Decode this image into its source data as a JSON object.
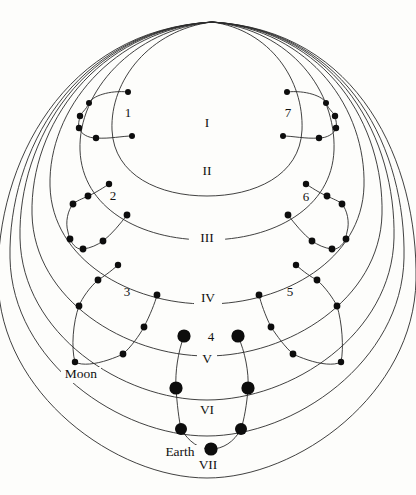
{
  "diagram": {
    "background_color": "#fdfdfb",
    "line_color": "#2b2b2b",
    "dot_color": "#0d0d0d",
    "apex": {
      "x": 212,
      "y": 22
    },
    "orbit_labels": [
      {
        "id": "orbit-I",
        "text": "I",
        "x": 207,
        "y": 124
      },
      {
        "id": "orbit-II",
        "text": "II",
        "x": 207,
        "y": 172
      },
      {
        "id": "orbit-III",
        "text": "III",
        "x": 207,
        "y": 239
      },
      {
        "id": "orbit-IV",
        "text": "IV",
        "x": 208,
        "y": 299
      },
      {
        "id": "orbit-V",
        "text": "V",
        "x": 207,
        "y": 360
      },
      {
        "id": "orbit-VI",
        "text": "VI",
        "x": 207,
        "y": 411
      },
      {
        "id": "orbit-VII",
        "text": "VII",
        "x": 208,
        "y": 466
      }
    ],
    "epicycle_labels": [
      {
        "id": "epicycle-1",
        "text": "1",
        "x": 128,
        "y": 114
      },
      {
        "id": "epicycle-2",
        "text": "2",
        "x": 113,
        "y": 197
      },
      {
        "id": "epicycle-3",
        "text": "3",
        "x": 127,
        "y": 293
      },
      {
        "id": "epicycle-4",
        "text": "4",
        "x": 211,
        "y": 338
      },
      {
        "id": "epicycle-5",
        "text": "5",
        "x": 290,
        "y": 293
      },
      {
        "id": "epicycle-6",
        "text": "6",
        "x": 306,
        "y": 198
      },
      {
        "id": "epicycle-7",
        "text": "7",
        "x": 288,
        "y": 114
      }
    ],
    "body_labels": [
      {
        "id": "label-moon",
        "text": "Moon",
        "x": 81,
        "y": 375
      },
      {
        "id": "label-earth",
        "text": "Earth",
        "x": 180,
        "y": 453
      }
    ],
    "orbit_arcs": [
      {
        "id": "arc-I",
        "d": "M212,22 C150,30 110,80 112,130 C114,176 160,196 207,196 C254,196 300,176 302,130 C304,80 270,30 212,22"
      },
      {
        "id": "arc-II",
        "d": "M212,22 C132,30 78,92 80,150 C82,208 140,240 207,240 C274,240 332,208 334,150 C336,92 292,30 212,22"
      },
      {
        "id": "arc-III",
        "d": "M212,22 C112,30 48,110 50,186 C52,260 130,304 207,304 C284,304 362,260 364,186 C366,110 312,30 212,22"
      },
      {
        "id": "arc-IV",
        "d": "M212,22 C96,30 30,126 32,214 C34,300 126,356 207,356 C288,356 380,300 382,214 C384,126 328,30 212,22"
      },
      {
        "id": "arc-V",
        "d": "M212,22 C84,30 18,140 20,238 C22,334 122,400 207,400 C292,400 392,334 394,238 C396,140 340,30 212,22"
      },
      {
        "id": "arc-VI",
        "d": "M212,22 C74,30 8,152 10,258 C12,362 120,436 207,436 C294,436 402,362 404,258 C406,152 350,30 212,22"
      },
      {
        "id": "arc-VII",
        "d": "M212,22 C64,30 -4,164 -2,280 C0,394 116,478 207,478 C298,478 414,394 416,280 C418,164 360,30 212,22"
      }
    ],
    "epicycle_chains": [
      {
        "id": "chain-1",
        "dots": [
          {
            "x": 128,
            "y": 92,
            "r": 3.0
          },
          {
            "x": 89,
            "y": 103,
            "r": 3.0
          },
          {
            "x": 132,
            "y": 136,
            "r": 3.0
          },
          {
            "x": 80,
            "y": 116,
            "r": 3.2
          },
          {
            "x": 79,
            "y": 128,
            "r": 3.2
          },
          {
            "x": 96,
            "y": 138,
            "r": 3.2
          }
        ],
        "path": "M128,92 C110,90 92,96 89,103 C86,110 81,113 80,116 C79,121 78,124 79,128 C81,134 88,138 96,138 C110,139 122,136 132,136"
      },
      {
        "id": "chain-2",
        "dots": [
          {
            "x": 109,
            "y": 184,
            "r": 3.2
          },
          {
            "x": 88,
            "y": 196,
            "r": 3.4
          },
          {
            "x": 73,
            "y": 204,
            "r": 3.4
          },
          {
            "x": 127,
            "y": 215,
            "r": 3.4
          },
          {
            "x": 70,
            "y": 239,
            "r": 3.4
          },
          {
            "x": 83,
            "y": 249,
            "r": 3.4
          },
          {
            "x": 103,
            "y": 241,
            "r": 3.4
          }
        ],
        "path": "M109,184 C100,190 93,194 88,196 C82,199 76,201 73,204 C68,210 65,222 68,232 C69,236 69,238 70,239 C73,246 78,250 83,249 C91,248 97,245 103,241 C112,234 120,224 127,215"
      },
      {
        "id": "chain-3",
        "dots": [
          {
            "x": 118,
            "y": 265,
            "r": 3.2
          },
          {
            "x": 98,
            "y": 280,
            "r": 3.4
          },
          {
            "x": 157,
            "y": 295,
            "r": 3.4
          },
          {
            "x": 79,
            "y": 306,
            "r": 3.4
          },
          {
            "x": 144,
            "y": 327,
            "r": 3.4
          },
          {
            "x": 75,
            "y": 362,
            "r": 3.2
          },
          {
            "x": 123,
            "y": 354,
            "r": 3.4
          }
        ],
        "path": "M118,265 C110,272 103,277 98,280 C90,287 82,298 79,306 C73,322 71,348 75,362 C82,366 96,364 108,360 C114,358 119,356 123,354 C131,347 139,336 144,327 C150,315 155,303 157,295"
      },
      {
        "id": "chain-4",
        "dots": [
          {
            "x": 184,
            "y": 336,
            "r": 6.6
          },
          {
            "x": 238,
            "y": 336,
            "r": 6.6
          },
          {
            "x": 176,
            "y": 388,
            "r": 6.6
          },
          {
            "x": 248,
            "y": 388,
            "r": 6.6
          },
          {
            "x": 181,
            "y": 429,
            "r": 6.0
          },
          {
            "x": 241,
            "y": 429,
            "r": 6.0
          },
          {
            "x": 211,
            "y": 449,
            "r": 6.6
          }
        ],
        "path": "M184,336 C178,352 175,372 176,388 C177,404 179,420 181,429 C189,442 199,449 211,449 C223,449 234,442 241,429 C244,420 247,404 248,388 C249,372 245,352 238,336"
      },
      {
        "id": "chain-5",
        "dots": [
          {
            "x": 296,
            "y": 265,
            "r": 3.2
          },
          {
            "x": 317,
            "y": 280,
            "r": 3.4
          },
          {
            "x": 259,
            "y": 295,
            "r": 3.4
          },
          {
            "x": 337,
            "y": 306,
            "r": 3.4
          },
          {
            "x": 271,
            "y": 327,
            "r": 3.4
          },
          {
            "x": 341,
            "y": 362,
            "r": 3.2
          },
          {
            "x": 293,
            "y": 354,
            "r": 3.4
          }
        ],
        "path": "M296,265 C304,272 311,277 317,280 C325,287 333,298 337,306 C342,322 344,348 341,362 C334,366 320,364 308,360 C302,358 297,356 293,354 C285,347 277,336 271,327 C265,315 261,303 259,295"
      },
      {
        "id": "chain-6",
        "dots": [
          {
            "x": 306,
            "y": 184,
            "r": 3.2
          },
          {
            "x": 327,
            "y": 196,
            "r": 3.4
          },
          {
            "x": 342,
            "y": 204,
            "r": 3.4
          },
          {
            "x": 288,
            "y": 215,
            "r": 3.4
          },
          {
            "x": 346,
            "y": 239,
            "r": 3.4
          },
          {
            "x": 332,
            "y": 249,
            "r": 3.4
          },
          {
            "x": 312,
            "y": 241,
            "r": 3.4
          }
        ],
        "path": "M306,184 C315,190 322,194 327,196 C333,199 339,201 342,204 C347,210 350,222 347,232 C346,236 346,238 346,239 C342,246 337,250 332,249 C324,248 318,245 312,241 C303,234 295,224 288,215"
      },
      {
        "id": "chain-7",
        "dots": [
          {
            "x": 287,
            "y": 92,
            "r": 3.0
          },
          {
            "x": 326,
            "y": 103,
            "r": 3.0
          },
          {
            "x": 283,
            "y": 136,
            "r": 3.0
          },
          {
            "x": 335,
            "y": 116,
            "r": 3.2
          },
          {
            "x": 336,
            "y": 128,
            "r": 3.2
          },
          {
            "x": 319,
            "y": 138,
            "r": 3.2
          }
        ],
        "path": "M287,92 C305,90 323,96 326,103 C329,110 334,113 335,116 C336,121 337,124 336,128 C334,134 327,138 319,138 C305,139 293,136 283,136"
      }
    ]
  }
}
